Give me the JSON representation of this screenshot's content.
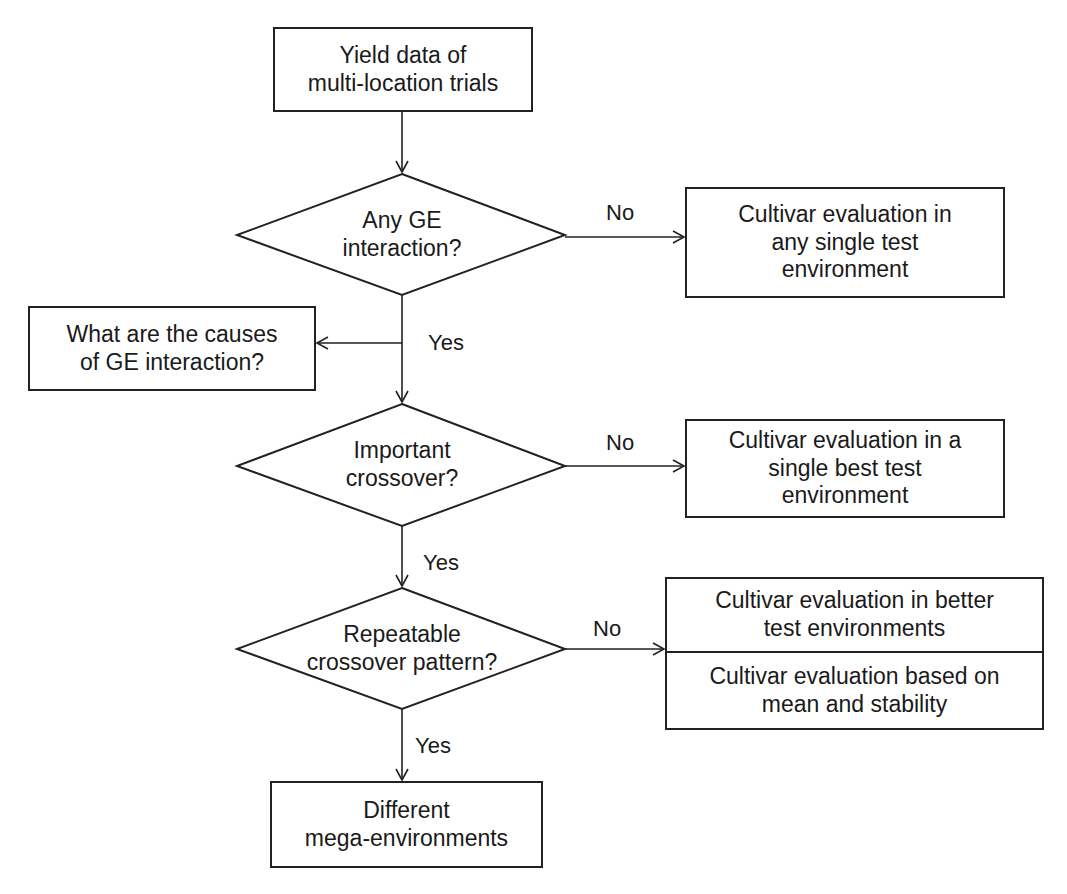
{
  "nodes": {
    "start": {
      "text": "Yield data of\nmulti-location trials"
    },
    "decision1": {
      "text": "Any GE\ninteraction?"
    },
    "outcome1": {
      "text": "Cultivar evaluation in\nany single test\nenvironment"
    },
    "causes": {
      "text": "What are the causes\nof GE interaction?"
    },
    "decision2": {
      "text": "Important\ncrossover?"
    },
    "outcome2": {
      "text": "Cultivar evaluation in a\nsingle best test\nenvironment"
    },
    "decision3": {
      "text": "Repeatable\ncrossover pattern?"
    },
    "outcome3a": {
      "text": "Cultivar evaluation in better\ntest environments"
    },
    "outcome3b": {
      "text": "Cultivar evaluation based on\nmean and stability"
    },
    "end": {
      "text": "Different\nmega-environments"
    }
  },
  "edge_labels": {
    "d1_no": "No",
    "d1_yes": "Yes",
    "d2_no": "No",
    "d2_yes": "Yes",
    "d3_no": "No",
    "d3_yes": "Yes"
  },
  "colors": {
    "stroke": "#222222",
    "background": "#ffffff",
    "text": "#1a1a1a"
  }
}
